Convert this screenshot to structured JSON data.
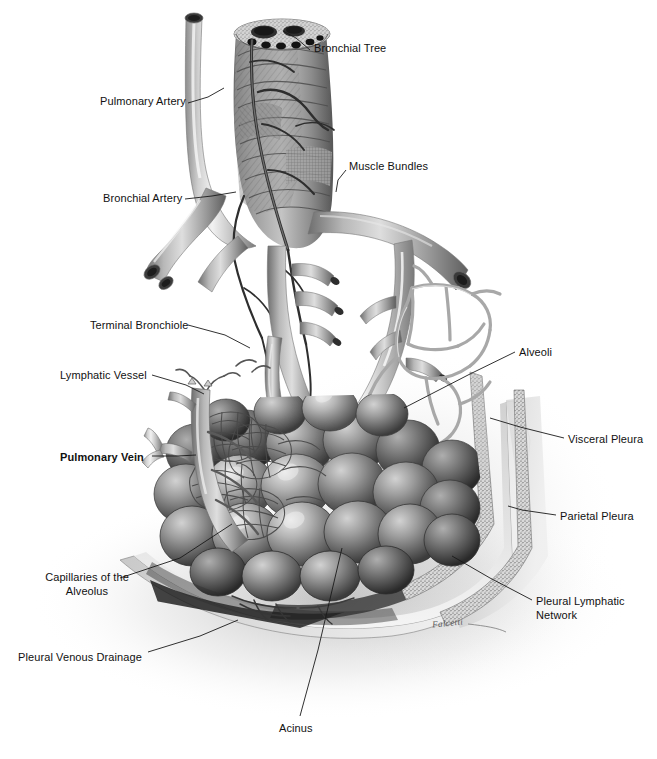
{
  "figure": {
    "width": 657,
    "height": 759,
    "background_color": "#ffffff",
    "ink_color": "#1a1a1a",
    "label_font_size_px": 11,
    "style": "grayscale airbrush medical illustration"
  },
  "signature": {
    "text": "Falcetti",
    "x": 432,
    "y": 618
  },
  "labels": [
    {
      "id": "bronchial-tree",
      "text": "Bronchial Tree",
      "x": 314,
      "y": 41,
      "align": "left",
      "bold": false,
      "leader": [
        [
          310,
          50
        ],
        [
          296,
          38
        ],
        [
          283,
          31
        ]
      ]
    },
    {
      "id": "pulmonary-artery",
      "text": "Pulmonary Artery",
      "x": 100,
      "y": 94,
      "align": "left",
      "bold": false,
      "leader": [
        [
          188,
          103
        ],
        [
          208,
          97
        ],
        [
          224,
          88
        ]
      ]
    },
    {
      "id": "muscle-bundles",
      "text": "Muscle Bundles",
      "x": 349,
      "y": 159,
      "align": "left",
      "bold": false,
      "leader": [
        [
          346,
          170
        ],
        [
          338,
          180
        ],
        [
          336,
          192
        ]
      ]
    },
    {
      "id": "bronchial-artery",
      "text": "Bronchial Artery",
      "x": 103,
      "y": 191,
      "align": "left",
      "bold": false,
      "leader": [
        [
          185,
          199
        ],
        [
          212,
          196
        ],
        [
          236,
          192
        ]
      ]
    },
    {
      "id": "terminal-bronchiole",
      "text": "Terminal Bronchiole",
      "x": 90,
      "y": 318,
      "align": "left",
      "bold": false,
      "leader": [
        [
          188,
          325
        ],
        [
          225,
          335
        ],
        [
          250,
          348
        ]
      ]
    },
    {
      "id": "alveoli",
      "text": "Alveoli",
      "x": 519,
      "y": 345,
      "align": "left",
      "bold": false,
      "leader": [
        [
          515,
          352
        ],
        [
          470,
          374
        ],
        [
          404,
          408
        ]
      ]
    },
    {
      "id": "lymphatic-vessel",
      "text": "Lymphatic Vessel",
      "x": 60,
      "y": 368,
      "align": "left",
      "bold": false,
      "leader": [
        [
          152,
          375
        ],
        [
          186,
          385
        ],
        [
          204,
          394
        ]
      ]
    },
    {
      "id": "visceral-pleura",
      "text": "Visceral Pleura",
      "x": 568,
      "y": 432,
      "align": "left",
      "bold": false,
      "leader": [
        [
          564,
          438
        ],
        [
          520,
          427
        ],
        [
          490,
          418
        ]
      ]
    },
    {
      "id": "pulmonary-vein",
      "text": "Pulmonary Vein",
      "x": 60,
      "y": 450,
      "align": "left",
      "bold": true,
      "leader": [
        [
          152,
          456
        ],
        [
          178,
          456
        ],
        [
          196,
          455
        ]
      ]
    },
    {
      "id": "parietal-pleura",
      "text": "Parietal Pleura",
      "x": 560,
      "y": 509,
      "align": "left",
      "bold": false,
      "leader": [
        [
          556,
          515
        ],
        [
          522,
          510
        ],
        [
          508,
          506
        ]
      ]
    },
    {
      "id": "capillaries-of-the-alveolus",
      "text": "Capillaries of the\nAlveolus",
      "line1": "Capillaries of the",
      "line2": "Alveolus",
      "x": 30,
      "y": 570,
      "align": "left",
      "bold": false,
      "leader": [
        [
          120,
          578
        ],
        [
          180,
          558
        ],
        [
          232,
          524
        ]
      ]
    },
    {
      "id": "pleural-lymphatic-network",
      "text": "Pleural Lymphatic\nNetwork",
      "line1": "Pleural Lymphatic",
      "line2": "Network",
      "x": 536,
      "y": 594,
      "align": "left",
      "bold": false,
      "leader": [
        [
          532,
          600
        ],
        [
          490,
          578
        ],
        [
          452,
          556
        ]
      ]
    },
    {
      "id": "pleural-venous-drainage",
      "text": "Pleural Venous Drainage",
      "x": 18,
      "y": 650,
      "align": "left",
      "bold": false,
      "leader": [
        [
          148,
          652
        ],
        [
          200,
          636
        ],
        [
          238,
          620
        ]
      ]
    },
    {
      "id": "acinus",
      "text": "Acinus",
      "x": 279,
      "y": 721,
      "align": "left",
      "bold": false,
      "leader": [
        [
          300,
          716
        ],
        [
          318,
          650
        ],
        [
          342,
          548
        ]
      ]
    }
  ],
  "structures": [
    {
      "id": "main-bronchus",
      "name": "Main bronchus with cartilage rings and muscle bundles"
    },
    {
      "id": "pulmonary-artery-vessel",
      "name": "Pulmonary artery trunk descending at left of bronchus"
    },
    {
      "id": "bronchial-artery-vessel",
      "name": "Small bronchial artery branching along bronchus wall"
    },
    {
      "id": "bronchial-branches",
      "name": "Bifurcating bronchial branches"
    },
    {
      "id": "terminal-bronchiole-branch",
      "name": "Terminal bronchiole descending into acinus"
    },
    {
      "id": "lymphatic-vessel-branch",
      "name": "Lymphatic vessel with valved branches"
    },
    {
      "id": "pulmonary-vein-vessel",
      "name": "Pulmonary vein trunk at lower left"
    },
    {
      "id": "alveolar-sac-mass",
      "name": "Cluster of alveolar sacs forming the acinus"
    },
    {
      "id": "capillary-network",
      "name": "Capillary mesh over alveolar surfaces"
    },
    {
      "id": "pleural-lymphatic-mesh",
      "name": "Open polygonal pleural lymphatic network at right"
    },
    {
      "id": "visceral-pleura-layer",
      "name": "Stippled visceral pleura membrane"
    },
    {
      "id": "parietal-pleura-layer",
      "name": "Stippled parietal pleura membrane with chest wall"
    },
    {
      "id": "chest-wall",
      "name": "Curved chest wall cutaway surface"
    }
  ]
}
